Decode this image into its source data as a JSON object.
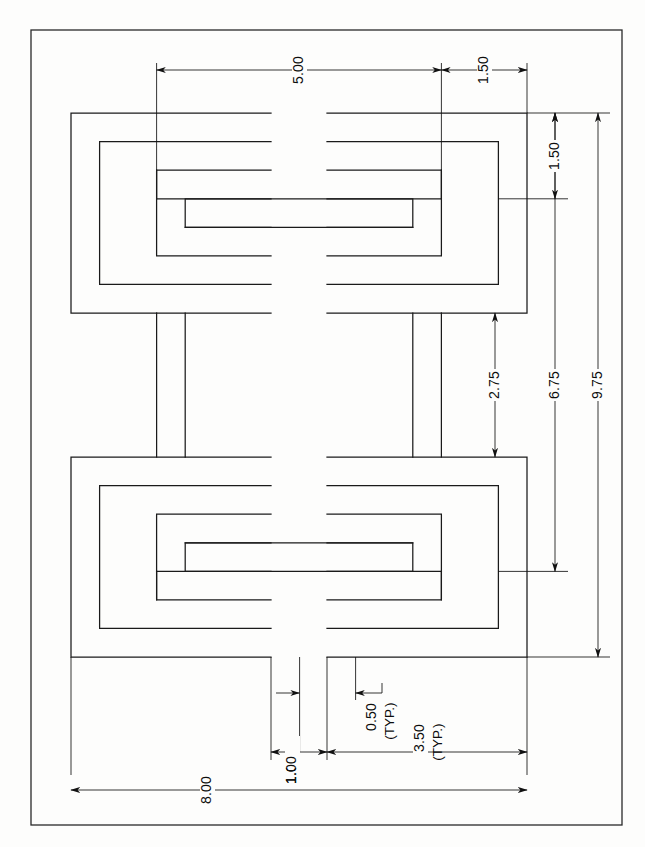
{
  "drawing": {
    "title": "Greek Key Interlocking Pattern",
    "units_note": "",
    "border": {
      "x": 31,
      "y": 30,
      "width": 591,
      "height": 795,
      "color": "#222222"
    },
    "line_color": "#1a1a1a",
    "background": "#fdfdfc"
  },
  "dimensions": {
    "top": [
      {
        "id": "dim-5-00",
        "label": "5.00",
        "orientation": "horizontal",
        "value": 5.0
      },
      {
        "id": "dim-1-50-top",
        "label": "1.50",
        "orientation": "horizontal",
        "value": 1.5
      }
    ],
    "right": [
      {
        "id": "dim-1-50-right",
        "label": "1.50",
        "orientation": "vertical",
        "value": 1.5
      },
      {
        "id": "dim-2-75",
        "label": "2.75",
        "orientation": "vertical",
        "value": 2.75
      },
      {
        "id": "dim-6-75",
        "label": "6.75",
        "orientation": "vertical",
        "value": 6.75
      },
      {
        "id": "dim-9-75",
        "label": "9.75",
        "orientation": "vertical",
        "value": 9.75
      }
    ],
    "bottom": [
      {
        "id": "dim-0-50",
        "label": "0.50",
        "sublabel": "(TYP.)",
        "orientation": "horizontal",
        "value": 0.5
      },
      {
        "id": "dim-1-00",
        "label": "1.00",
        "orientation": "horizontal",
        "value": 1.0
      },
      {
        "id": "dim-3-50",
        "label": "3.50",
        "sublabel": "(TYP.)",
        "orientation": "horizontal",
        "value": 3.5
      },
      {
        "id": "dim-8-00",
        "label": "8.00",
        "orientation": "horizontal",
        "value": 8.0
      }
    ]
  },
  "labels": {
    "d5_00": "5.00",
    "d1_50_top": "1.50",
    "d1_50_right": "1.50",
    "d2_75": "2.75",
    "d6_75": "6.75",
    "d9_75": "9.75",
    "d0_50": "0.50",
    "d0_50_typ": "(TYP.)",
    "d1_00": "1.00",
    "d3_50": "3.50",
    "d3_50_typ": "(TYP.)",
    "d8_00": "8.00"
  },
  "geometry": {
    "description": "Four Greek-key (square spiral) motifs arranged 2x2, joined by horizontal and vertical connecting bands",
    "band_width_units": 0.5,
    "motif_size_units": 3.5,
    "overall_width_units": 8.0,
    "overall_height_units": 9.75,
    "motifs": [
      {
        "id": "motif-top-left",
        "position": "top-left"
      },
      {
        "id": "motif-top-right",
        "position": "top-right"
      },
      {
        "id": "motif-bottom-left",
        "position": "bottom-left"
      },
      {
        "id": "motif-bottom-right",
        "position": "bottom-right"
      }
    ],
    "connectors": [
      {
        "id": "connector-top-horizontal",
        "orientation": "horizontal"
      },
      {
        "id": "connector-bottom-horizontal",
        "orientation": "horizontal"
      },
      {
        "id": "connector-left-vertical",
        "orientation": "vertical"
      },
      {
        "id": "connector-right-vertical",
        "orientation": "vertical"
      }
    ]
  }
}
